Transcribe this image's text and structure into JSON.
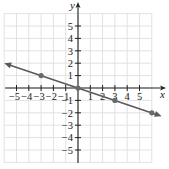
{
  "chart_data": {
    "type": "line",
    "title": "",
    "xlabel": "x",
    "ylabel": "y",
    "xlim": [
      -6,
      6
    ],
    "ylim": [
      -6,
      6
    ],
    "grid": true,
    "x_ticks": [
      -5,
      -4,
      -3,
      -2,
      -1,
      1,
      2,
      3,
      4,
      5
    ],
    "x_tick_labels": [
      "−5",
      "−4",
      "−3",
      "−2",
      "−1",
      "1",
      "2",
      "3",
      "4",
      "5"
    ],
    "y_ticks": [
      5,
      4,
      3,
      2,
      1,
      -1,
      -2,
      -3,
      -4,
      -5
    ],
    "y_tick_labels": [
      "5",
      "4",
      "3",
      "2",
      "1",
      "−1",
      "−2",
      "−3",
      "−4",
      "−5"
    ],
    "series": [
      {
        "name": "y = -x/3",
        "equation": "y = -(1/3)x",
        "points": [
          {
            "x": -3,
            "y": 1
          },
          {
            "x": 0,
            "y": 0
          },
          {
            "x": 3,
            "y": -1
          },
          {
            "x": 6,
            "y": -2
          }
        ],
        "extends_both_directions": true,
        "line_start": {
          "x": -6,
          "y": 2
        },
        "line_end": {
          "x": 6.8,
          "y": -2.27
        }
      }
    ]
  },
  "colors": {
    "axis": "#222222",
    "grid": "#e2e2e2",
    "line": "#5a5a5a",
    "point": "#6a6a6a",
    "text": "#222222"
  }
}
